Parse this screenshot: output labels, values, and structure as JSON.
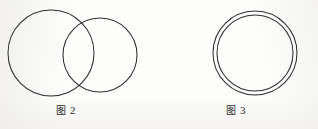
{
  "page": {
    "width": 318,
    "height": 129,
    "background_color": "#fdfdfc",
    "stroke_color": "#2e2e2e",
    "text_color": "#2b2b2b"
  },
  "figures": [
    {
      "id": "figure-2",
      "caption_label": "图",
      "caption_number": "2",
      "caption_full": "图 2",
      "description": "two-overlapping-circles",
      "shapes": [
        {
          "name": "left-circle",
          "type": "circle",
          "cx": 51,
          "cy": 53,
          "r": 43
        },
        {
          "name": "right-circle",
          "type": "circle",
          "cx": 100,
          "cy": 55,
          "r": 37
        }
      ]
    },
    {
      "id": "figure-3",
      "caption_label": "图",
      "caption_number": "3",
      "caption_full": "图 3",
      "description": "two-concentric-circles",
      "shapes": [
        {
          "name": "outer-circle",
          "type": "circle",
          "cx": 95,
          "cy": 53,
          "r": 42
        },
        {
          "name": "inner-circle",
          "type": "circle",
          "cx": 95,
          "cy": 53,
          "r": 38
        }
      ]
    }
  ]
}
